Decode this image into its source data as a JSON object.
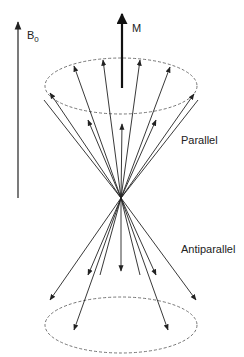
{
  "diagram": {
    "labels": {
      "b0_main": "B",
      "b0_sub": "0",
      "magnetization": "M",
      "parallel": "Parallel",
      "antiparallel": "Antiparallel"
    },
    "colors": {
      "line": "#222222",
      "dashed": "#666666",
      "background": "#ffffff"
    },
    "field_arrow": {
      "x": 18,
      "y_top": 20,
      "y_bottom": 198
    },
    "m_arrow": {
      "x": 122,
      "y_top": 12,
      "y_bottom": 88
    },
    "vertex": {
      "x": 121,
      "y": 198
    },
    "upper_cone": {
      "cx": 121,
      "cy": 86,
      "rx": 76,
      "ry": 28,
      "vector_count": 12
    },
    "lower_cone": {
      "cx": 121,
      "cy": 325,
      "rx": 76,
      "ry": 28,
      "vector_count": 9
    }
  }
}
